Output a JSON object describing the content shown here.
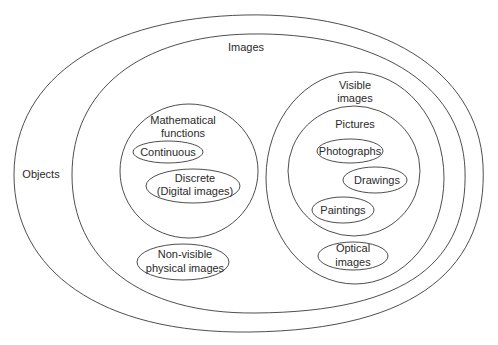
{
  "diagram": {
    "type": "nested-set-diagram",
    "sets": {
      "objects": {
        "label": "Objects"
      },
      "images": {
        "label": "Images"
      },
      "mathematical_functions": {
        "label_line1": "Mathematical",
        "label_line2": "functions",
        "children": {
          "continuous": {
            "label": "Continuous"
          },
          "discrete": {
            "label_line1": "Discrete",
            "label_line2": "(Digital images)"
          }
        }
      },
      "non_visible_physical_images": {
        "label_line1": "Non-visible",
        "label_line2": "physical images"
      },
      "visible_images": {
        "label_line1": "Visible",
        "label_line2": "images",
        "children": {
          "pictures": {
            "label": "Pictures",
            "children": {
              "photographs": {
                "label": "Photographs"
              },
              "drawings": {
                "label": "Drawings"
              },
              "paintings": {
                "label": "Paintings"
              }
            }
          },
          "optical_images": {
            "label_line1": "Optical",
            "label_line2": "images"
          }
        }
      }
    },
    "colors": {
      "line": "#3a3a3a",
      "text": "#2a2a2a",
      "background": "#ffffff"
    }
  }
}
